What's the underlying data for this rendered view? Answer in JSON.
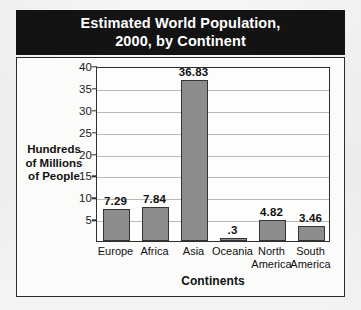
{
  "chart_data": {
    "type": "bar",
    "title": "Estimated World Population,\n2000, by Continent",
    "xlabel": "Continents",
    "ylabel": "Hundreds\nof Millions\nof People",
    "categories": [
      "Europe",
      "Africa",
      "Asia",
      "Oceania",
      "North\nAmerica",
      "South\nAmerica"
    ],
    "values": [
      7.29,
      7.84,
      36.83,
      0.3,
      4.82,
      3.46
    ],
    "value_labels": [
      "7.29",
      "7.84",
      "36.83",
      ".3",
      "4.82",
      "3.46"
    ],
    "ylim": [
      0,
      40
    ],
    "yticks": [
      5,
      10,
      15,
      20,
      25,
      30,
      35,
      40
    ],
    "ytick_labels": [
      "5",
      "10",
      "15",
      "20",
      "25",
      "30",
      "35",
      "40"
    ],
    "grid": true,
    "legend": null,
    "colors": {
      "bar_fill": "#8c8c8c",
      "bar_edge": "#343434",
      "title_band": "#131313",
      "title_text": "#ffffff",
      "gridline": "#b9b9b7",
      "axis": "#2f2f2f",
      "plot_background": "#fdfdfc",
      "page_background": "#f2f2f0"
    }
  }
}
